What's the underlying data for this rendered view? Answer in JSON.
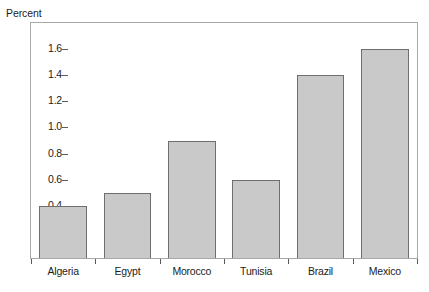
{
  "chart_data": {
    "type": "bar",
    "title": "",
    "xlabel": "",
    "ylabel": "Percent",
    "categories": [
      "Algeria",
      "Egypt",
      "Morocco",
      "Tunisia",
      "Brazil",
      "Mexico"
    ],
    "values": [
      0.4,
      0.5,
      0.9,
      0.6,
      1.4,
      1.6
    ],
    "ylim": [
      0,
      1.8
    ],
    "ytick_labels": [
      "1.6",
      "1.4",
      "1.2",
      "1.0",
      "0.8",
      "0.6",
      "0.4",
      "0.2"
    ],
    "ytick_values": [
      1.6,
      1.4,
      1.2,
      1.0,
      0.8,
      0.6,
      0.4,
      0.2
    ],
    "grid": false,
    "legend": false,
    "legend_position": "none",
    "bar_fill_color": "#c9c9c9",
    "bar_border_color": "#6e6e6e",
    "frame_color": "#a8a8a8",
    "text_color": "#1c1c1c",
    "background_color": "#ffffff"
  }
}
